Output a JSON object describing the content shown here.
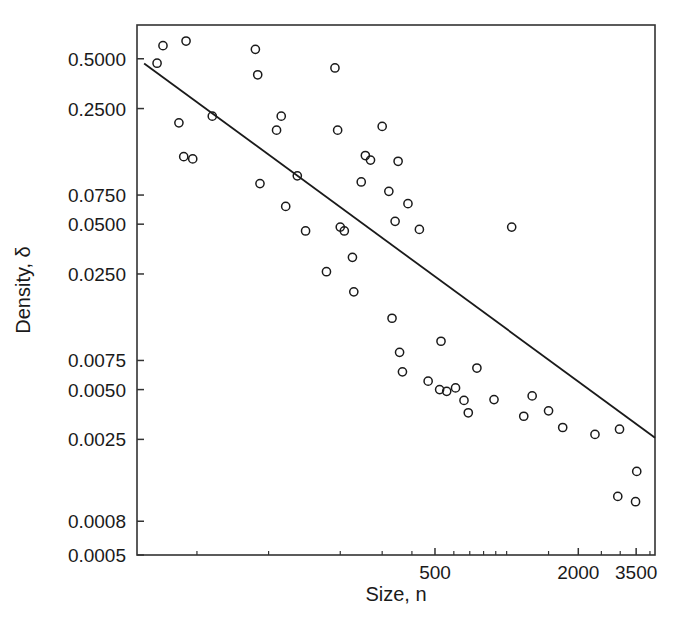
{
  "chart_data": {
    "type": "scatter",
    "title": "",
    "xlabel": "Size, n",
    "ylabel": "Density, δ",
    "xscale": "log",
    "yscale": "log",
    "grid": false,
    "legend": "none",
    "xlim": [
      28,
      4200
    ],
    "ylim": [
      0.0005,
      0.8
    ],
    "xticks": [
      500,
      2000,
      3500
    ],
    "xtick_labels": [
      "500",
      "2000",
      "3500"
    ],
    "yticks": [
      0.5,
      0.25,
      0.075,
      0.05,
      0.025,
      0.0075,
      0.005,
      0.0025,
      0.0008,
      0.0005
    ],
    "ytick_labels": [
      "0.5000",
      "0.2500",
      "0.0750",
      "0.0500",
      "0.0250",
      "0.0075",
      "0.0050",
      "0.0025",
      "0.0008",
      "0.0005"
    ],
    "marker": "open-circle",
    "marker_color": "#1a1a1a",
    "line_color": "#1a1a1a",
    "points": [
      {
        "x": 36,
        "y": 0.6
      },
      {
        "x": 34,
        "y": 0.47
      },
      {
        "x": 45,
        "y": 0.64
      },
      {
        "x": 88,
        "y": 0.57
      },
      {
        "x": 90,
        "y": 0.4
      },
      {
        "x": 190,
        "y": 0.44
      },
      {
        "x": 42,
        "y": 0.205
      },
      {
        "x": 58,
        "y": 0.225
      },
      {
        "x": 113,
        "y": 0.225
      },
      {
        "x": 108,
        "y": 0.185
      },
      {
        "x": 195,
        "y": 0.185
      },
      {
        "x": 300,
        "y": 0.195
      },
      {
        "x": 44,
        "y": 0.128
      },
      {
        "x": 48,
        "y": 0.124
      },
      {
        "x": 255,
        "y": 0.13
      },
      {
        "x": 268,
        "y": 0.122
      },
      {
        "x": 350,
        "y": 0.12
      },
      {
        "x": 92,
        "y": 0.088
      },
      {
        "x": 132,
        "y": 0.098
      },
      {
        "x": 245,
        "y": 0.09
      },
      {
        "x": 320,
        "y": 0.079
      },
      {
        "x": 118,
        "y": 0.064
      },
      {
        "x": 385,
        "y": 0.0665
      },
      {
        "x": 143,
        "y": 0.0455
      },
      {
        "x": 200,
        "y": 0.048
      },
      {
        "x": 208,
        "y": 0.0455
      },
      {
        "x": 340,
        "y": 0.052
      },
      {
        "x": 430,
        "y": 0.0465
      },
      {
        "x": 1050,
        "y": 0.048
      },
      {
        "x": 225,
        "y": 0.0315
      },
      {
        "x": 175,
        "y": 0.0258
      },
      {
        "x": 228,
        "y": 0.0195
      },
      {
        "x": 330,
        "y": 0.0135
      },
      {
        "x": 355,
        "y": 0.0084
      },
      {
        "x": 530,
        "y": 0.0098
      },
      {
        "x": 365,
        "y": 0.0064
      },
      {
        "x": 468,
        "y": 0.00562
      },
      {
        "x": 750,
        "y": 0.00675
      },
      {
        "x": 523,
        "y": 0.005
      },
      {
        "x": 560,
        "y": 0.00488
      },
      {
        "x": 610,
        "y": 0.00512
      },
      {
        "x": 662,
        "y": 0.0043
      },
      {
        "x": 690,
        "y": 0.00362
      },
      {
        "x": 885,
        "y": 0.00435
      },
      {
        "x": 1280,
        "y": 0.00458
      },
      {
        "x": 1180,
        "y": 0.00345
      },
      {
        "x": 1500,
        "y": 0.00372
      },
      {
        "x": 1720,
        "y": 0.00295
      },
      {
        "x": 2350,
        "y": 0.00268
      },
      {
        "x": 2980,
        "y": 0.00288
      },
      {
        "x": 3520,
        "y": 0.0016
      },
      {
        "x": 2930,
        "y": 0.00113
      },
      {
        "x": 3480,
        "y": 0.00105
      }
    ],
    "fit_line": {
      "label": "regression-line",
      "endpoints": [
        {
          "x": 30,
          "y": 0.468
        },
        {
          "x": 4200,
          "y": 0.00256
        }
      ]
    }
  }
}
